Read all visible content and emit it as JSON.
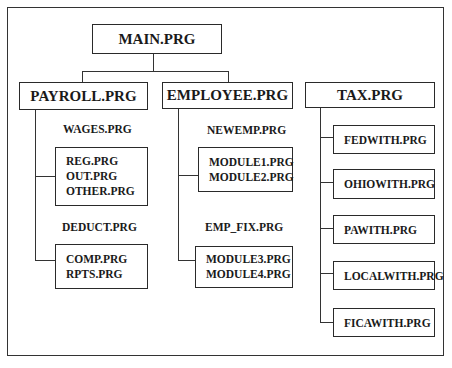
{
  "diagram": {
    "type": "module-hierarchy",
    "root": {
      "label": "MAIN.PRG"
    },
    "level1": [
      {
        "label": "PAYROLL.PRG"
      },
      {
        "label": "EMPLOYEE.PRG"
      },
      {
        "label": "TAX.PRG"
      }
    ],
    "payroll": {
      "groups": [
        {
          "label": "WAGES.PRG",
          "items": [
            "REG.PRG",
            "OUT.PRG",
            "OTHER.PRG"
          ]
        },
        {
          "label": "DEDUCT.PRG",
          "items": [
            "COMP.PRG",
            "RPTS.PRG"
          ]
        }
      ]
    },
    "employee": {
      "groups": [
        {
          "label": "NEWEMP.PRG",
          "items": [
            "MODULE1.PRG",
            "MODULE2.PRG"
          ]
        },
        {
          "label": "EMP_FIX.PRG",
          "items": [
            "MODULE3.PRG",
            "MODULE4.PRG"
          ]
        }
      ]
    },
    "tax": {
      "items": [
        "FEDWITH.PRG",
        "OHIOWITH.PRG",
        "PAWITH.PRG",
        "LOCALWITH.PRG",
        "FICAWITH.PRG"
      ]
    }
  }
}
